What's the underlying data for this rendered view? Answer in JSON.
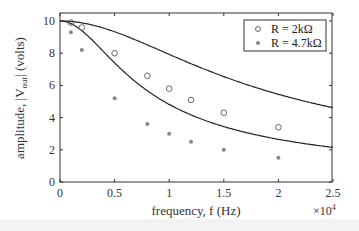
{
  "chart_data": {
    "type": "scatter",
    "title": "",
    "xlabel": "frequency, f (Hz)",
    "ylabel_parts": {
      "prefix": "amplitude, |V",
      "sub": "out",
      "suffix": "| (volts)"
    },
    "ylabel": "amplitude, |V_out| (volts)",
    "x_multiplier": "×10",
    "x_multiplier_exp": "4",
    "xlim": [
      0,
      2.5
    ],
    "ylim": [
      0,
      10.5
    ],
    "xticks": [
      "0",
      "0.5",
      "1",
      "1.5",
      "2",
      "2.5"
    ],
    "yticks": [
      "0",
      "2",
      "4",
      "6",
      "8",
      "10"
    ],
    "grid": false,
    "legend_position": "upper right",
    "series": [
      {
        "name": "R = 2kΩ",
        "marker": "open-circle",
        "color": "#666666",
        "x": [
          0.1,
          0.2,
          0.5,
          0.8,
          1.0,
          1.2,
          1.5,
          2.0
        ],
        "values": [
          9.9,
          9.6,
          8.0,
          6.6,
          5.8,
          5.1,
          4.3,
          3.4
        ],
        "fit_curve": {
          "cutoff": 1.3,
          "amplitude": 10
        }
      },
      {
        "name": "R = 4.7kΩ",
        "marker": "filled-dot",
        "color": "#888888",
        "x": [
          0.1,
          0.2,
          0.5,
          0.8,
          1.0,
          1.2,
          1.5,
          2.0
        ],
        "values": [
          9.3,
          8.2,
          5.2,
          3.6,
          3.0,
          2.5,
          2.0,
          1.5
        ],
        "fit_curve": {
          "cutoff": 0.55,
          "amplitude": 10
        }
      }
    ]
  }
}
